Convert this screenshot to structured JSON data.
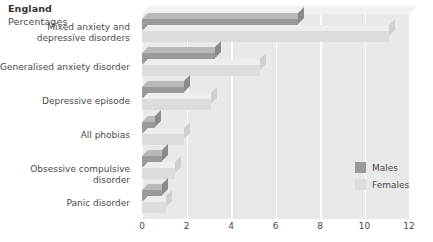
{
  "chart_data": {
    "type": "bar",
    "orientation": "horizontal",
    "title": "England",
    "subtitle": "Percentages",
    "xlabel": "",
    "ylabel": "",
    "xlim": [
      0,
      12
    ],
    "xticks": [
      "0",
      "2",
      "4",
      "6",
      "8",
      "10",
      "12"
    ],
    "grid": true,
    "legend_position": "right",
    "categories": [
      "Mixed anxiety and depressive disorders",
      "Generalised anxiety disorder",
      "Depressive episode",
      "All phobias",
      "Obsessive compulsive disorder",
      "Panic disorder"
    ],
    "category_lines": [
      [
        "Mixed anxiety and",
        "depressive disorders"
      ],
      [
        "Generalised anxiety disorder"
      ],
      [
        "Depressive episode"
      ],
      [
        "All phobias"
      ],
      [
        "Obsessive compulsive disorder"
      ],
      [
        "Panic disorder"
      ]
    ],
    "series": [
      {
        "name": "Males",
        "color": "#9a9a9a",
        "values": [
          7.0,
          3.3,
          1.9,
          0.6,
          0.9,
          0.9
        ]
      },
      {
        "name": "Females",
        "color": "#dcdcdc",
        "values": [
          11.1,
          5.3,
          3.1,
          1.9,
          1.5,
          1.1
        ]
      }
    ]
  },
  "legend": {
    "items": [
      {
        "label": "Males"
      },
      {
        "label": "Females"
      }
    ]
  }
}
